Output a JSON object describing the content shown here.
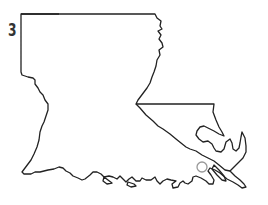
{
  "question": {
    "number": "3"
  },
  "map": {
    "region": "Louisiana outline",
    "outline_color": "#222222",
    "marker": {
      "shape": "circle",
      "color": "#999999",
      "cx": 202,
      "cy": 167,
      "r": 5
    }
  }
}
